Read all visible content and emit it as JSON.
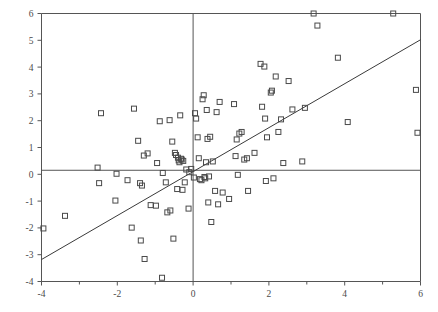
{
  "figure": {
    "type": "scatter-plot",
    "background_color": "#ffffff",
    "frame_color": "#555555",
    "marker_color": "#4a4a4a",
    "line_color": "#3a3a3a",
    "partial_caption": "the bottom edge"
  },
  "chart_data": {
    "type": "scatter",
    "title": "",
    "subtitle": "",
    "xlabel": "",
    "ylabel": "",
    "xlim": [
      -4,
      6
    ],
    "ylim": [
      -4,
      6
    ],
    "grid": false,
    "legend": "none",
    "xticks": [
      -4,
      -2,
      0,
      2,
      4,
      6
    ],
    "xticklabels": [
      "-4",
      "-2",
      "0",
      "2",
      "4",
      "6"
    ],
    "yticks": [
      -4,
      -3,
      -2,
      -1,
      0,
      1,
      2,
      3,
      4,
      5,
      6
    ],
    "yticklabels": [
      "-4",
      "-3",
      "-2",
      "-1",
      "0",
      "1",
      "2",
      "3",
      "4",
      "5",
      "6"
    ],
    "minor_xticks": [
      -3,
      -1,
      1,
      3,
      5
    ],
    "reference_lines": [
      {
        "name": "vertical-zero-line",
        "orientation": "vertical",
        "value": 0
      },
      {
        "name": "horizontal-zero-line",
        "orientation": "horizontal",
        "value": 0.15
      }
    ],
    "fit_line": {
      "name": "regression-line",
      "x0": -4.0,
      "y0": -3.18,
      "x1": 6.0,
      "y1": 5.02,
      "slope": 0.82,
      "intercept": 0.1
    },
    "marker_style": "open-square",
    "marker_size": 5,
    "n_points": 112,
    "points": [
      [
        -3.95,
        -2.02
      ],
      [
        -3.38,
        -1.55
      ],
      [
        -2.52,
        0.25
      ],
      [
        -2.48,
        -0.33
      ],
      [
        -2.43,
        2.28
      ],
      [
        -2.05,
        -0.98
      ],
      [
        -2.02,
        0.02
      ],
      [
        -1.73,
        -0.22
      ],
      [
        -1.62,
        -1.99
      ],
      [
        -1.56,
        2.45
      ],
      [
        -1.45,
        1.25
      ],
      [
        -1.4,
        -0.33
      ],
      [
        -1.38,
        -2.47
      ],
      [
        -1.35,
        -0.42
      ],
      [
        -1.3,
        0.7
      ],
      [
        -1.28,
        -3.16
      ],
      [
        -1.2,
        0.78
      ],
      [
        -1.12,
        -1.15
      ],
      [
        -0.98,
        -1.17
      ],
      [
        -0.95,
        0.42
      ],
      [
        -0.88,
        1.98
      ],
      [
        -0.82,
        -3.86
      ],
      [
        -0.8,
        0.05
      ],
      [
        -0.72,
        -0.3
      ],
      [
        -0.68,
        -1.42
      ],
      [
        -0.62,
        2.02
      ],
      [
        -0.6,
        -1.35
      ],
      [
        -0.55,
        1.22
      ],
      [
        -0.52,
        -2.4
      ],
      [
        -0.48,
        0.8
      ],
      [
        -0.45,
        0.72
      ],
      [
        -0.42,
        -0.55
      ],
      [
        -0.4,
        0.62
      ],
      [
        -0.38,
        0.52
      ],
      [
        -0.36,
        0.45
      ],
      [
        -0.34,
        2.2
      ],
      [
        -0.32,
        0.58
      ],
      [
        -0.3,
        0.55
      ],
      [
        -0.28,
        -0.58
      ],
      [
        -0.26,
        0.5
      ],
      [
        -0.22,
        -0.3
      ],
      [
        -0.18,
        0.18
      ],
      [
        -0.12,
        -1.28
      ],
      [
        -0.1,
        0.08
      ],
      [
        -0.05,
        0.2
      ],
      [
        0.02,
        -0.12
      ],
      [
        0.05,
        2.28
      ],
      [
        0.08,
        2.08
      ],
      [
        0.12,
        1.38
      ],
      [
        0.15,
        0.6
      ],
      [
        0.18,
        -0.18
      ],
      [
        0.22,
        -0.22
      ],
      [
        0.25,
        2.8
      ],
      [
        0.28,
        2.95
      ],
      [
        0.3,
        -0.1
      ],
      [
        0.32,
        -0.15
      ],
      [
        0.34,
        0.45
      ],
      [
        0.36,
        2.4
      ],
      [
        0.38,
        1.32
      ],
      [
        0.4,
        -1.05
      ],
      [
        0.42,
        -0.08
      ],
      [
        0.45,
        1.4
      ],
      [
        0.48,
        -1.78
      ],
      [
        0.52,
        0.48
      ],
      [
        0.58,
        -0.62
      ],
      [
        0.62,
        2.32
      ],
      [
        0.66,
        -1.12
      ],
      [
        0.7,
        2.7
      ],
      [
        0.78,
        -0.68
      ],
      [
        0.95,
        -0.92
      ],
      [
        1.08,
        2.62
      ],
      [
        1.12,
        0.68
      ],
      [
        1.15,
        1.3
      ],
      [
        1.18,
        -0.02
      ],
      [
        1.22,
        1.52
      ],
      [
        1.28,
        1.58
      ],
      [
        1.35,
        0.55
      ],
      [
        1.42,
        0.6
      ],
      [
        1.45,
        -0.62
      ],
      [
        1.62,
        0.8
      ],
      [
        1.78,
        4.12
      ],
      [
        1.82,
        2.52
      ],
      [
        1.88,
        4.02
      ],
      [
        1.9,
        2.08
      ],
      [
        1.92,
        -0.25
      ],
      [
        1.95,
        1.38
      ],
      [
        2.05,
        3.05
      ],
      [
        2.08,
        3.12
      ],
      [
        2.12,
        -0.15
      ],
      [
        2.18,
        3.65
      ],
      [
        2.25,
        1.58
      ],
      [
        2.32,
        2.05
      ],
      [
        2.38,
        0.42
      ],
      [
        2.52,
        3.48
      ],
      [
        2.62,
        2.42
      ],
      [
        2.88,
        0.48
      ],
      [
        2.95,
        2.48
      ],
      [
        3.18,
        6.0
      ],
      [
        3.28,
        5.55
      ],
      [
        3.82,
        4.35
      ],
      [
        4.08,
        1.95
      ],
      [
        5.28,
        6.0
      ],
      [
        5.88,
        3.15
      ],
      [
        5.92,
        1.55
      ]
    ]
  }
}
